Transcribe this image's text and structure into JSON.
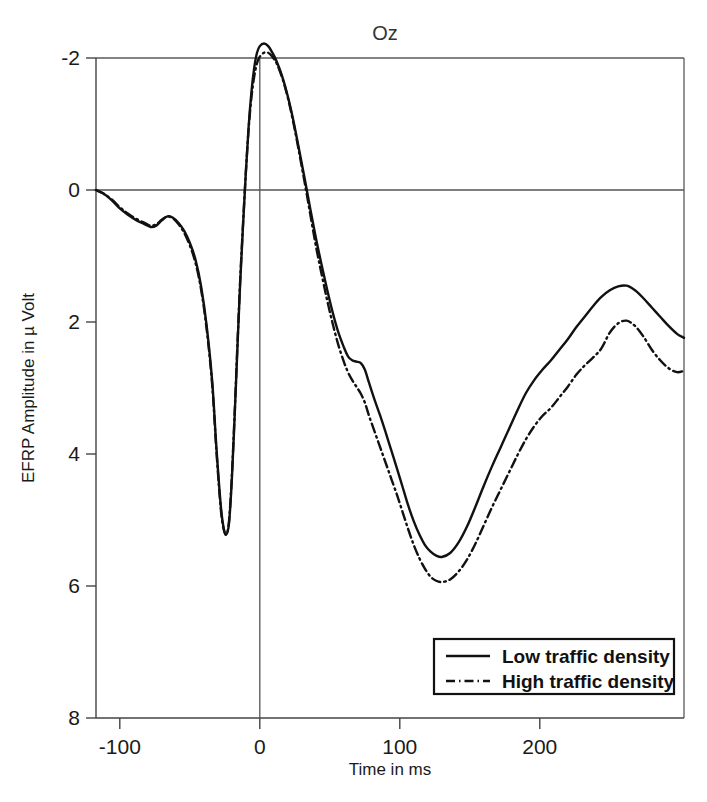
{
  "chart_data": {
    "type": "line",
    "title": "Oz",
    "xlabel": "Time in ms",
    "ylabel": "EFRP Amplitude in µ Volt",
    "xlim": [
      -117,
      303
    ],
    "ylim": [
      -2,
      8
    ],
    "y_inverted": true,
    "grid": false,
    "legend_position": "bottom-right",
    "xticks": [
      -100,
      0,
      100,
      200
    ],
    "xtick_labels": [
      "-100",
      "0",
      "100",
      "200"
    ],
    "yticks": [
      -2,
      0,
      2,
      4,
      6,
      8
    ],
    "ytick_labels": [
      "-2",
      "0",
      "2",
      "4",
      "6",
      "8"
    ],
    "zero_time_marker": 0,
    "zero_amplitude_line": 0,
    "legend": [
      {
        "name": "Low traffic density",
        "style": "solid"
      },
      {
        "name": "High traffic density",
        "style": "dash-dot"
      }
    ],
    "series": [
      {
        "name": "Low traffic density",
        "style": "solid",
        "x": [
          -117,
          -112,
          -106,
          -100,
          -94,
          -88,
          -82,
          -78,
          -74,
          -70,
          -66,
          -62,
          -58,
          -54,
          -50,
          -46,
          -42,
          -38,
          -34,
          -31,
          -28,
          -26,
          -24,
          -22,
          -20,
          -18,
          -16,
          -14,
          -12,
          -10,
          -8,
          -6,
          -4,
          -2,
          0,
          3,
          6,
          9,
          12,
          16,
          20,
          24,
          28,
          32,
          36,
          40,
          44,
          48,
          52,
          56,
          60,
          63,
          66,
          69,
          72,
          75,
          78,
          82,
          86,
          90,
          94,
          98,
          102,
          106,
          110,
          114,
          118,
          122,
          126,
          130,
          136,
          142,
          148,
          154,
          160,
          166,
          172,
          178,
          184,
          190,
          196,
          202,
          208,
          214,
          220,
          226,
          232,
          238,
          244,
          250,
          256,
          262,
          268,
          274,
          280,
          286,
          292,
          298,
          303
        ],
        "y": [
          0.0,
          0.05,
          0.15,
          0.28,
          0.38,
          0.46,
          0.52,
          0.56,
          0.54,
          0.46,
          0.4,
          0.42,
          0.5,
          0.62,
          0.8,
          1.05,
          1.45,
          2.05,
          2.9,
          3.9,
          4.75,
          5.1,
          5.22,
          5.05,
          4.4,
          3.45,
          2.4,
          1.4,
          0.55,
          -0.25,
          -0.95,
          -1.48,
          -1.85,
          -2.08,
          -2.18,
          -2.22,
          -2.18,
          -2.08,
          -1.95,
          -1.72,
          -1.42,
          -1.05,
          -0.62,
          -0.18,
          0.28,
          0.72,
          1.12,
          1.5,
          1.85,
          2.15,
          2.38,
          2.52,
          2.58,
          2.6,
          2.62,
          2.72,
          2.92,
          3.18,
          3.42,
          3.68,
          3.95,
          4.22,
          4.5,
          4.78,
          5.02,
          5.22,
          5.38,
          5.48,
          5.54,
          5.56,
          5.5,
          5.34,
          5.1,
          4.8,
          4.48,
          4.18,
          3.9,
          3.62,
          3.34,
          3.08,
          2.88,
          2.72,
          2.58,
          2.42,
          2.26,
          2.08,
          1.92,
          1.76,
          1.62,
          1.52,
          1.46,
          1.45,
          1.52,
          1.64,
          1.78,
          1.92,
          2.06,
          2.18,
          2.24
        ]
      },
      {
        "name": "High traffic density",
        "style": "dash-dot",
        "x": [
          -117,
          -112,
          -106,
          -100,
          -94,
          -88,
          -82,
          -78,
          -74,
          -70,
          -66,
          -62,
          -58,
          -54,
          -50,
          -46,
          -42,
          -38,
          -34,
          -31,
          -28,
          -26,
          -24,
          -22,
          -20,
          -18,
          -16,
          -14,
          -12,
          -10,
          -8,
          -6,
          -4,
          -2,
          0,
          3,
          6,
          9,
          12,
          16,
          20,
          24,
          28,
          32,
          36,
          40,
          44,
          48,
          52,
          56,
          60,
          63,
          66,
          69,
          72,
          75,
          78,
          82,
          86,
          90,
          94,
          98,
          102,
          106,
          110,
          114,
          118,
          122,
          126,
          130,
          136,
          142,
          148,
          154,
          160,
          166,
          172,
          178,
          184,
          190,
          196,
          202,
          208,
          214,
          220,
          226,
          232,
          238,
          244,
          250,
          256,
          262,
          268,
          274,
          280,
          286,
          292,
          298,
          303
        ],
        "y": [
          0.0,
          0.05,
          0.14,
          0.26,
          0.36,
          0.44,
          0.5,
          0.54,
          0.52,
          0.45,
          0.4,
          0.43,
          0.52,
          0.65,
          0.84,
          1.1,
          1.5,
          2.1,
          2.95,
          3.95,
          4.8,
          5.12,
          5.22,
          5.02,
          4.35,
          3.4,
          2.35,
          1.36,
          0.52,
          -0.26,
          -0.92,
          -1.4,
          -1.72,
          -1.92,
          -2.02,
          -2.08,
          -2.08,
          -2.02,
          -1.92,
          -1.7,
          -1.4,
          -1.02,
          -0.58,
          -0.12,
          0.36,
          0.84,
          1.26,
          1.66,
          2.02,
          2.34,
          2.6,
          2.76,
          2.88,
          2.98,
          3.08,
          3.22,
          3.42,
          3.66,
          3.9,
          4.14,
          4.38,
          4.62,
          4.88,
          5.14,
          5.38,
          5.58,
          5.74,
          5.86,
          5.92,
          5.94,
          5.9,
          5.78,
          5.6,
          5.36,
          5.08,
          4.8,
          4.54,
          4.28,
          4.02,
          3.78,
          3.58,
          3.42,
          3.3,
          3.14,
          2.98,
          2.8,
          2.66,
          2.54,
          2.4,
          2.16,
          2.02,
          1.98,
          2.06,
          2.22,
          2.42,
          2.58,
          2.7,
          2.76,
          2.74
        ]
      }
    ]
  },
  "plot_geometry": {
    "left": 96,
    "right": 684,
    "top": 58,
    "bottom": 718
  },
  "legend_panel": {
    "x": 434,
    "y": 639,
    "width": 240,
    "height": 55
  }
}
